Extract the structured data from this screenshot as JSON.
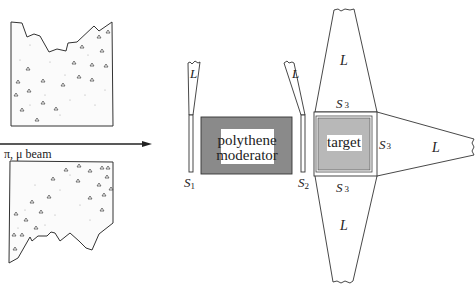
{
  "figure": {
    "beam_label": "π, μ beam",
    "blocks": {
      "moderator_line1": "polythene",
      "moderator_line2": "moderator",
      "target": "target"
    },
    "counters": {
      "s1": "S",
      "s1_sub": "1",
      "s2": "S",
      "s2_sub": "2",
      "s3": "S",
      "s3_sub": "3"
    },
    "light_guide_label": "L",
    "colors": {
      "moderator_fill": "#8a8a8a",
      "target_fill": "#b8b8b8",
      "line": "#333333",
      "label_bg": "#ffffff"
    }
  }
}
